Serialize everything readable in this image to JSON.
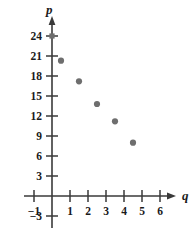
{
  "chart_data": {
    "type": "scatter",
    "title": "",
    "subtitle": "",
    "xlabel": "q",
    "ylabel": "p",
    "grid": false,
    "legend": null,
    "xlim": [
      -1.7,
      7.2
    ],
    "ylim": [
      -4.5,
      26.5
    ],
    "xticks": [
      -1,
      1,
      2,
      3,
      4,
      5,
      6
    ],
    "xtick_labels": [
      "−1",
      "1",
      "2",
      "3",
      "4",
      "5",
      "6"
    ],
    "yticks": [
      -3,
      3,
      6,
      9,
      12,
      15,
      18,
      21,
      24
    ],
    "ytick_labels": [
      "−3",
      "3",
      "6",
      "9",
      "12",
      "15",
      "18",
      "21",
      "24"
    ],
    "point_color": "#6e6e6e",
    "axis_color": "#3a3a3a",
    "x": [
      0.5,
      1.5,
      2.5,
      3.5,
      4.5
    ],
    "y": [
      20.3,
      17.2,
      13.8,
      11.2,
      8.0
    ],
    "points": [
      {
        "q": 0.5,
        "p": 20.3
      },
      {
        "q": 1.5,
        "p": 17.2
      },
      {
        "q": 2.5,
        "p": 13.8
      },
      {
        "q": 3.5,
        "p": 11.2
      },
      {
        "q": 4.5,
        "p": 8.0
      }
    ],
    "axis_marks": [
      {
        "q": 0,
        "p": 24
      }
    ]
  },
  "axes": {
    "y_name": "p",
    "x_name": "q"
  },
  "ticks": {
    "y": [
      {
        "value": 24,
        "label": "24"
      },
      {
        "value": 21,
        "label": "21"
      },
      {
        "value": 18,
        "label": "18"
      },
      {
        "value": 15,
        "label": "15"
      },
      {
        "value": 12,
        "label": "12"
      },
      {
        "value": 9,
        "label": "9"
      },
      {
        "value": 6,
        "label": "6"
      },
      {
        "value": 3,
        "label": "3"
      },
      {
        "value": -3,
        "label": "−3"
      }
    ],
    "x": [
      {
        "value": -1,
        "label": "−1"
      },
      {
        "value": 1,
        "label": "1"
      },
      {
        "value": 2,
        "label": "2"
      },
      {
        "value": 3,
        "label": "3"
      },
      {
        "value": 4,
        "label": "4"
      },
      {
        "value": 5,
        "label": "5"
      },
      {
        "value": 6,
        "label": "6"
      }
    ]
  }
}
